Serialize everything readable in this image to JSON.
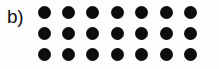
{
  "figure": {
    "panel_label": "b)",
    "background_color": "#fdfdfd",
    "dot_color": "#0d0d0d",
    "label_color": "#111111"
  },
  "chart_data": {
    "type": "scatter",
    "title": "b)",
    "xlabel": "",
    "ylabel": "",
    "rows": 3,
    "columns": 7,
    "dot_count": 21,
    "dot_diameter_px": 13,
    "column_spacing_px": 24.4,
    "row_spacing_px": 21,
    "x": [
      44,
      68.4,
      92.8,
      117.2,
      141.6,
      166,
      190.4
    ],
    "row_y": [
      12.5,
      33.5,
      54.5
    ],
    "grid": false,
    "legend": "none",
    "points": [
      {
        "row": 1,
        "col": 1,
        "x": 44,
        "y": 12.5
      },
      {
        "row": 1,
        "col": 2,
        "x": 68.4,
        "y": 12.5
      },
      {
        "row": 1,
        "col": 3,
        "x": 92.8,
        "y": 12.5
      },
      {
        "row": 1,
        "col": 4,
        "x": 117.2,
        "y": 12.5
      },
      {
        "row": 1,
        "col": 5,
        "x": 141.6,
        "y": 12.5
      },
      {
        "row": 1,
        "col": 6,
        "x": 166,
        "y": 12.5
      },
      {
        "row": 1,
        "col": 7,
        "x": 190.4,
        "y": 12.5
      },
      {
        "row": 2,
        "col": 1,
        "x": 44,
        "y": 33.5
      },
      {
        "row": 2,
        "col": 2,
        "x": 68.4,
        "y": 33.5
      },
      {
        "row": 2,
        "col": 3,
        "x": 92.8,
        "y": 33.5
      },
      {
        "row": 2,
        "col": 4,
        "x": 117.2,
        "y": 33.5
      },
      {
        "row": 2,
        "col": 5,
        "x": 141.6,
        "y": 33.5
      },
      {
        "row": 2,
        "col": 6,
        "x": 166,
        "y": 33.5
      },
      {
        "row": 2,
        "col": 7,
        "x": 190.4,
        "y": 33.5
      },
      {
        "row": 3,
        "col": 1,
        "x": 44,
        "y": 54.5
      },
      {
        "row": 3,
        "col": 2,
        "x": 68.4,
        "y": 54.5
      },
      {
        "row": 3,
        "col": 3,
        "x": 92.8,
        "y": 54.5
      },
      {
        "row": 3,
        "col": 4,
        "x": 117.2,
        "y": 54.5
      },
      {
        "row": 3,
        "col": 5,
        "x": 141.6,
        "y": 54.5
      },
      {
        "row": 3,
        "col": 6,
        "x": 166,
        "y": 54.5
      },
      {
        "row": 3,
        "col": 7,
        "x": 190.4,
        "y": 54.5
      }
    ]
  }
}
